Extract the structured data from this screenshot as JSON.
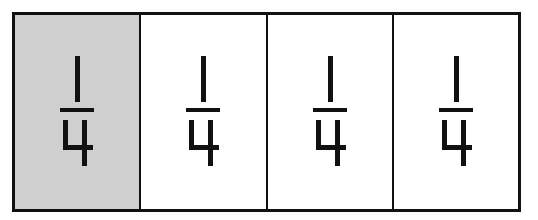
{
  "diagram": {
    "title": "",
    "type": "fraction-strip",
    "total_parts": 4,
    "shaded_parts": 1,
    "colors": {
      "shaded": "#cfcfcf",
      "unshaded": "#ffffff",
      "border": "#111111"
    },
    "cells": [
      {
        "numerator": "1",
        "denominator": "4",
        "shaded": true
      },
      {
        "numerator": "1",
        "denominator": "4",
        "shaded": false
      },
      {
        "numerator": "1",
        "denominator": "4",
        "shaded": false
      },
      {
        "numerator": "1",
        "denominator": "4",
        "shaded": false
      }
    ]
  }
}
